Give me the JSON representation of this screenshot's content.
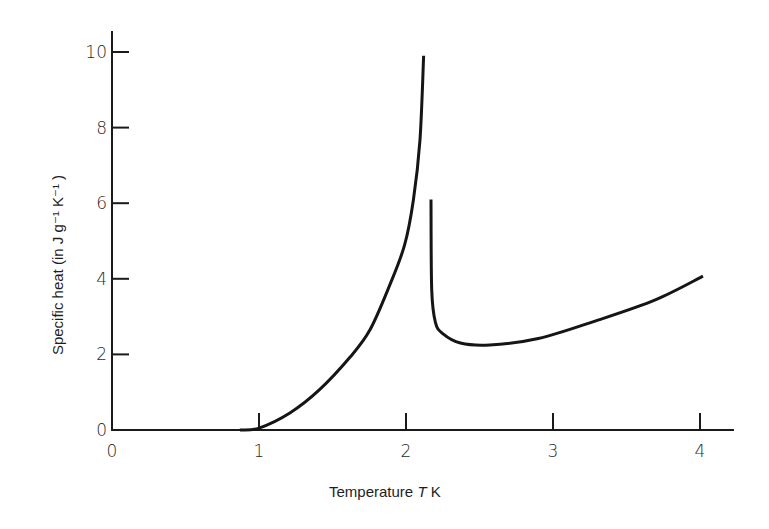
{
  "chart_data": {
    "type": "line",
    "title": "",
    "xlabel": "Temperature T K",
    "ylabel": "Specific heat (in J g⁻¹ K⁻¹ )",
    "xlim": [
      0,
      4.2
    ],
    "ylim": [
      0,
      10.3
    ],
    "grid": false,
    "legend": null,
    "x_ticks": [
      "0",
      "1",
      "2",
      "3",
      "4"
    ],
    "y_ticks": [
      "0",
      "2",
      "4",
      "6",
      "8",
      "10"
    ],
    "series": [
      {
        "name": "below lambda point",
        "x": [
          0.87,
          1.0,
          1.21,
          1.41,
          1.62,
          1.755,
          1.89,
          1.99,
          2.05,
          2.095,
          2.12
        ],
        "y": [
          0.0,
          0.05,
          0.45,
          1.06,
          1.93,
          2.65,
          3.84,
          4.89,
          6.08,
          7.67,
          9.9
        ]
      },
      {
        "name": "above lambda point",
        "x": [
          2.17,
          2.175,
          2.2,
          2.25,
          2.37,
          2.57,
          2.9,
          3.3,
          3.7,
          4.02
        ],
        "y": [
          6.1,
          3.7,
          2.85,
          2.55,
          2.3,
          2.25,
          2.42,
          2.9,
          3.45,
          4.07
        ]
      }
    ],
    "annotations": []
  }
}
